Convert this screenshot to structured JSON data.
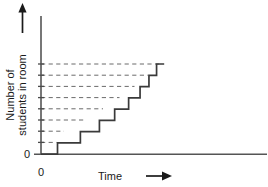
{
  "chart_data": {
    "type": "line",
    "subtype": "step",
    "title": "",
    "xlabel": "Time",
    "ylabel": "Number of students in room",
    "x_origin_label": "0",
    "y_origin_label": "0",
    "xlim": [
      0,
      10
    ],
    "ylim": [
      0,
      9
    ],
    "grid": true,
    "grid_style": "dashed-horizontal",
    "legend": null,
    "x_tick_labels": [
      "0"
    ],
    "y_tick_labels": [
      "0"
    ],
    "x_axis_arrow": true,
    "y_axis_arrow": true,
    "series": [
      {
        "name": "Students in room",
        "step_type": "post",
        "description": "Cumulative number of students arriving in the room over time; each arrival adds one student, arrivals become more frequent as time passes.",
        "points": [
          {
            "x": 0.0,
            "y": 0
          },
          {
            "x": 1.3,
            "y": 0
          },
          {
            "x": 1.3,
            "y": 1
          },
          {
            "x": 3.1,
            "y": 1
          },
          {
            "x": 3.1,
            "y": 2
          },
          {
            "x": 4.6,
            "y": 2
          },
          {
            "x": 4.6,
            "y": 3
          },
          {
            "x": 5.8,
            "y": 3
          },
          {
            "x": 5.8,
            "y": 4
          },
          {
            "x": 6.9,
            "y": 4
          },
          {
            "x": 6.9,
            "y": 5
          },
          {
            "x": 7.8,
            "y": 5
          },
          {
            "x": 7.8,
            "y": 6
          },
          {
            "x": 8.5,
            "y": 6
          },
          {
            "x": 8.5,
            "y": 7
          },
          {
            "x": 9.1,
            "y": 7
          },
          {
            "x": 9.1,
            "y": 8
          },
          {
            "x": 9.7,
            "y": 8
          }
        ]
      }
    ],
    "gridline_values": [
      1,
      2,
      3,
      4,
      5,
      6,
      7,
      8
    ],
    "colors": {
      "axis": "#555555",
      "curve": "#3a3a3a",
      "grid": "#6a6a6a",
      "text": "#1a1a1a",
      "background": "#ffffff"
    }
  },
  "labels": {
    "y_axis_line1": "Number of",
    "y_axis_line2": "students in room",
    "x_axis": "Time",
    "origin_y": "0",
    "origin_x": "0"
  }
}
